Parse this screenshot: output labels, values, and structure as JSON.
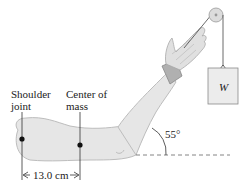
{
  "diagram": {
    "labels": {
      "shoulder_line1": "Shoulder",
      "shoulder_line2": "joint",
      "com_line1": "Center of",
      "com_line2": "mass",
      "distance": "13.0 cm",
      "angle": "55°",
      "weight": "W"
    },
    "colors": {
      "arm_fill": "#e6e6e6",
      "arm_stroke": "#b8b8b8",
      "line": "#333333",
      "box_fill": "#ececec"
    }
  }
}
